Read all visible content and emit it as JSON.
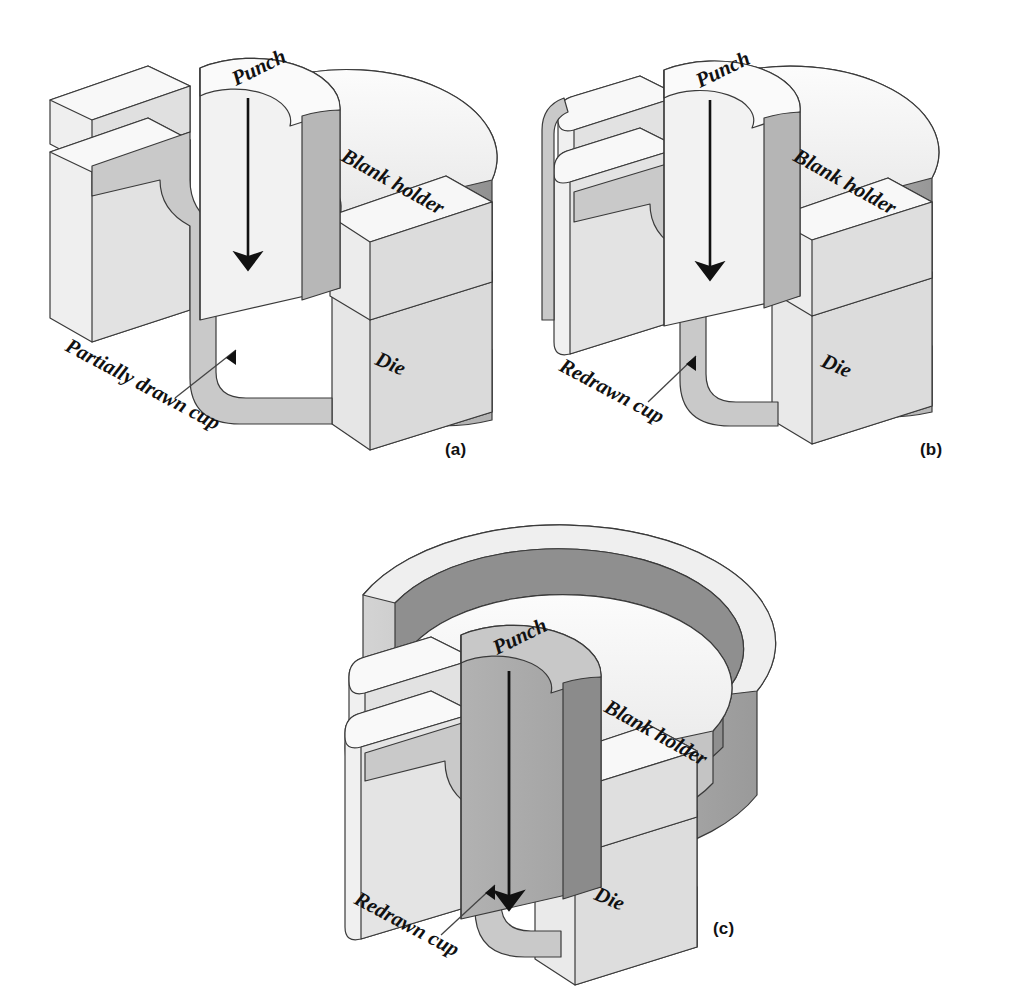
{
  "figure": {
    "type": "technical-diagram",
    "colors": {
      "background": "#ffffff",
      "outline": "#3a3a3a",
      "face_top": "#f4f4f4",
      "face_front": "#ededed",
      "face_side": "#d2d2d2",
      "face_shadow": "#9c9c9c",
      "sheet_metal": "#c9c9c9",
      "punch_dark": "#a8a8a8",
      "punch_dark_side": "#8e8e8e",
      "arrow": "#111111",
      "leader": "#444444",
      "text": "#111111"
    }
  },
  "panels": [
    {
      "id": "a",
      "caption": "(a)",
      "labels": {
        "punch": "Punch",
        "blank_holder": "Blank holder",
        "die": "Die",
        "workpiece": "Partially drawn cup"
      }
    },
    {
      "id": "b",
      "caption": "(b)",
      "labels": {
        "punch": "Punch",
        "blank_holder": "Blank holder",
        "die": "Die",
        "workpiece": "Redrawn cup"
      }
    },
    {
      "id": "c",
      "caption": "(c)",
      "labels": {
        "punch": "Punch",
        "blank_holder": "Blank holder",
        "die": "Die",
        "workpiece": "Redrawn cup"
      }
    }
  ]
}
